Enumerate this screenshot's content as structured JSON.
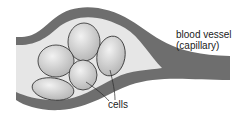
{
  "diagram": {
    "labels": {
      "vessel_line1": "blood vessel",
      "vessel_line2": "(capillary)",
      "cells": "cells"
    },
    "colors": {
      "vessel_wall": "#6e6e6e",
      "lumen": "#e6e6e6",
      "cell_fill": "#c8c8c8",
      "cell_outline": "#2a2a2a",
      "text": "#222222"
    },
    "cell_count": 5
  }
}
